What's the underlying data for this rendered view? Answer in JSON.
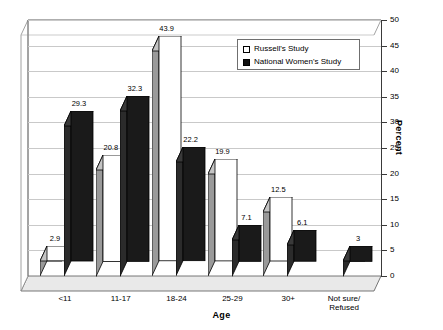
{
  "chart_data": {
    "type": "bar",
    "title": "",
    "xlabel": "Age",
    "ylabel": "Percent",
    "ylim": [
      0,
      50
    ],
    "ytick_step": 5,
    "yticks": [
      "0",
      "5",
      "10",
      "15",
      "20",
      "25",
      "30",
      "35",
      "40",
      "45",
      "50"
    ],
    "grid": true,
    "legend_position": "top-right",
    "style": "3d-grouped-bar",
    "categories": [
      "<11",
      "11-17",
      "18-24",
      "25-29",
      "30+",
      "Not sure/\nRefused"
    ],
    "series": [
      {
        "name": "Russell's Study",
        "swatch": "white",
        "color": "#ffffff",
        "values": [
          2.9,
          20.8,
          43.9,
          19.9,
          12.5,
          null
        ],
        "labels": [
          "2.9",
          "20.8",
          "43.9",
          "19.9",
          "12.5",
          ""
        ]
      },
      {
        "name": "National Women's Study",
        "swatch": "black",
        "color": "#1a1a1a",
        "values": [
          29.3,
          32.3,
          22.2,
          7.1,
          6.1,
          3
        ],
        "labels": [
          "29.3",
          "32.3",
          "22.2",
          "7.1",
          "6.1",
          "3"
        ]
      }
    ]
  },
  "legend": {
    "items": [
      {
        "label": "Russell's Study",
        "swatch": "white"
      },
      {
        "label": "National Women's Study",
        "swatch": "black"
      }
    ]
  },
  "axes": {
    "y_title": "Percent",
    "x_title": "Age"
  },
  "colors": {
    "series_white_face": "#ffffff",
    "series_white_side": "#9a9a9a",
    "series_black_face": "#1a1a1a",
    "series_black_side": "#2b2b2b",
    "grid": "#c9c9c9",
    "axis": "#3a3a3a",
    "background": "#ffffff"
  }
}
